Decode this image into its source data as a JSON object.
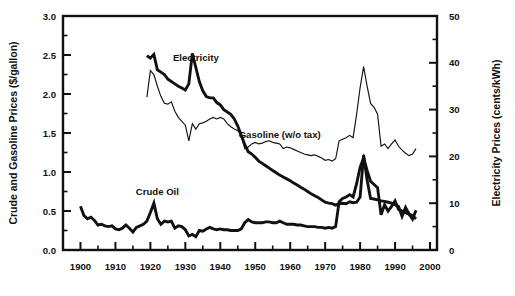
{
  "chart_data": {
    "type": "line",
    "title": "",
    "xlabel": "",
    "ylabel": "Crude and Gasoline Prices ($/gallon)",
    "ylabel_right": "Electricity Prices (cents/kWh)",
    "xlim": [
      1895,
      2002
    ],
    "ylim": [
      0.0,
      3.0
    ],
    "ylim_right": [
      0,
      50
    ],
    "grid": false,
    "legend_position": "inline-annotations",
    "xticks": [
      1900,
      1910,
      1920,
      1930,
      1940,
      1950,
      1960,
      1970,
      1980,
      1990,
      2000
    ],
    "xtick_labels": [
      "1900",
      "1910",
      "1920",
      "1930",
      "1940",
      "1950",
      "1960",
      "1970",
      "1980",
      "1990",
      "2000"
    ],
    "xticks_minor": [
      1905,
      1915,
      1925,
      1935,
      1945,
      1955,
      1965,
      1975,
      1985,
      1995
    ],
    "yticks": [
      0.0,
      0.5,
      1.0,
      1.5,
      2.0,
      2.5,
      3.0
    ],
    "ytick_labels": [
      "0.0",
      "0.5",
      "1.0",
      "1.5",
      "2.0",
      "2.5",
      "3.0"
    ],
    "yticks_minor": [
      0.25,
      0.75,
      1.25,
      1.75,
      2.25,
      2.75
    ],
    "yticks_right": [
      0,
      10,
      20,
      30,
      40,
      50
    ],
    "ytick_labels_right": [
      "0",
      "10",
      "20",
      "30",
      "40",
      "50"
    ],
    "yticks_right_minor": [
      5,
      15,
      25,
      35,
      45
    ],
    "annotations": [
      {
        "name": "electricity",
        "text": "Electricity",
        "x": 1933,
        "y": 2.42
      },
      {
        "name": "gasoline",
        "text": "Gasoline (w/o tax)",
        "x": 1957,
        "y": 1.43
      },
      {
        "name": "crude-oil",
        "text": "Crude Oil",
        "x": 1922,
        "y": 0.7
      }
    ],
    "series": [
      {
        "name": "Electricity",
        "axis": "right",
        "style": "thick",
        "units": "cents/kWh",
        "x": [
          1919,
          1920,
          1921,
          1922,
          1923,
          1924,
          1925,
          1926,
          1927,
          1928,
          1929,
          1930,
          1931,
          1932,
          1933,
          1934,
          1935,
          1936,
          1937,
          1938,
          1939,
          1940,
          1941,
          1942,
          1943,
          1944,
          1945,
          1946,
          1947,
          1948,
          1949,
          1950,
          1951,
          1952,
          1953,
          1954,
          1955,
          1956,
          1957,
          1958,
          1959,
          1960,
          1961,
          1962,
          1963,
          1964,
          1965,
          1966,
          1967,
          1968,
          1969,
          1970,
          1971,
          1972,
          1973,
          1974,
          1975,
          1976,
          1977,
          1978,
          1979,
          1980,
          1981,
          1982,
          1983,
          1984,
          1985,
          1986,
          1987,
          1988,
          1989,
          1990,
          1991,
          1992,
          1993,
          1994,
          1995,
          1996
        ],
        "values": [
          41.5,
          41.0,
          41.8,
          38.5,
          38.0,
          37.5,
          36.5,
          36.0,
          35.5,
          35.0,
          34.6,
          34.2,
          35.5,
          42.0,
          39.0,
          36.0,
          34.0,
          32.8,
          32.5,
          32.5,
          31.5,
          31.0,
          30.0,
          29.5,
          29.0,
          28.0,
          26.5,
          24.5,
          22.5,
          21.0,
          20.5,
          19.8,
          19.0,
          18.5,
          18.0,
          17.5,
          17.0,
          16.5,
          16.0,
          15.6,
          15.2,
          14.8,
          14.3,
          13.9,
          13.4,
          13.0,
          12.5,
          12.0,
          11.6,
          11.2,
          10.7,
          10.2,
          10.0,
          9.9,
          9.6,
          9.9,
          10.0,
          9.9,
          10.3,
          10.1,
          10.2,
          11.3,
          20.3,
          15.0,
          11.0,
          10.9,
          10.7,
          10.5,
          10.4,
          10.2,
          10.0,
          9.7,
          9.3,
          7.2,
          9.1,
          7.7,
          6.6,
          8.5
        ]
      },
      {
        "name": "Gasoline (w/o tax)",
        "axis": "left",
        "style": "thin",
        "units": "$/gallon",
        "x": [
          1919,
          1920,
          1921,
          1922,
          1923,
          1924,
          1925,
          1926,
          1927,
          1928,
          1929,
          1930,
          1931,
          1932,
          1933,
          1934,
          1935,
          1936,
          1937,
          1938,
          1939,
          1940,
          1941,
          1942,
          1943,
          1944,
          1945,
          1946,
          1947,
          1948,
          1949,
          1950,
          1951,
          1952,
          1953,
          1954,
          1955,
          1956,
          1957,
          1958,
          1959,
          1960,
          1961,
          1962,
          1963,
          1964,
          1965,
          1966,
          1967,
          1968,
          1969,
          1970,
          1971,
          1972,
          1973,
          1974,
          1975,
          1976,
          1977,
          1978,
          1979,
          1980,
          1981,
          1982,
          1983,
          1984,
          1985,
          1986,
          1987,
          1988,
          1989,
          1990,
          1991,
          1992,
          1993,
          1994,
          1995,
          1996
        ],
        "values": [
          1.96,
          2.3,
          2.25,
          2.1,
          1.97,
          1.88,
          1.87,
          1.9,
          1.78,
          1.7,
          1.65,
          1.6,
          1.4,
          1.62,
          1.55,
          1.62,
          1.63,
          1.65,
          1.68,
          1.7,
          1.68,
          1.7,
          1.68,
          1.62,
          1.58,
          1.55,
          1.53,
          1.47,
          1.3,
          1.32,
          1.36,
          1.38,
          1.36,
          1.37,
          1.39,
          1.4,
          1.38,
          1.37,
          1.36,
          1.3,
          1.32,
          1.31,
          1.29,
          1.27,
          1.25,
          1.23,
          1.22,
          1.21,
          1.22,
          1.2,
          1.18,
          1.15,
          1.16,
          1.14,
          1.17,
          1.4,
          1.42,
          1.44,
          1.47,
          1.44,
          1.74,
          2.08,
          2.35,
          2.1,
          1.88,
          1.83,
          1.74,
          1.33,
          1.36,
          1.3,
          1.36,
          1.41,
          1.33,
          1.28,
          1.24,
          1.21,
          1.23,
          1.3
        ]
      },
      {
        "name": "Crude Oil",
        "axis": "left",
        "style": "thick",
        "units": "$/gallon",
        "x": [
          1900,
          1901,
          1902,
          1903,
          1904,
          1905,
          1906,
          1907,
          1908,
          1909,
          1910,
          1911,
          1912,
          1913,
          1914,
          1915,
          1916,
          1917,
          1918,
          1919,
          1920,
          1921,
          1922,
          1923,
          1924,
          1925,
          1926,
          1927,
          1928,
          1929,
          1930,
          1931,
          1932,
          1933,
          1934,
          1935,
          1936,
          1937,
          1938,
          1939,
          1940,
          1941,
          1942,
          1943,
          1944,
          1945,
          1946,
          1947,
          1948,
          1949,
          1950,
          1951,
          1952,
          1953,
          1954,
          1955,
          1956,
          1957,
          1958,
          1959,
          1960,
          1961,
          1962,
          1963,
          1964,
          1965,
          1966,
          1967,
          1968,
          1969,
          1970,
          1971,
          1972,
          1973,
          1974,
          1975,
          1976,
          1977,
          1978,
          1979,
          1980,
          1981,
          1982,
          1983,
          1984,
          1985,
          1986,
          1987,
          1988,
          1989,
          1990,
          1991,
          1992,
          1993,
          1994,
          1995,
          1996
        ],
        "values": [
          0.56,
          0.44,
          0.4,
          0.42,
          0.38,
          0.32,
          0.33,
          0.31,
          0.3,
          0.31,
          0.27,
          0.26,
          0.28,
          0.32,
          0.28,
          0.23,
          0.29,
          0.31,
          0.33,
          0.37,
          0.48,
          0.6,
          0.4,
          0.33,
          0.37,
          0.36,
          0.37,
          0.28,
          0.31,
          0.3,
          0.26,
          0.18,
          0.2,
          0.17,
          0.25,
          0.24,
          0.27,
          0.29,
          0.27,
          0.26,
          0.27,
          0.26,
          0.26,
          0.25,
          0.25,
          0.25,
          0.27,
          0.35,
          0.39,
          0.36,
          0.35,
          0.35,
          0.35,
          0.36,
          0.36,
          0.35,
          0.35,
          0.37,
          0.35,
          0.33,
          0.33,
          0.33,
          0.32,
          0.32,
          0.31,
          0.3,
          0.3,
          0.3,
          0.29,
          0.29,
          0.28,
          0.29,
          0.28,
          0.3,
          0.62,
          0.66,
          0.68,
          0.71,
          0.68,
          0.85,
          1.06,
          1.18,
          1.02,
          0.88,
          0.84,
          0.8,
          0.45,
          0.58,
          0.5,
          0.56,
          0.63,
          0.52,
          0.5,
          0.48,
          0.46,
          0.44,
          0.4
        ]
      }
    ]
  }
}
